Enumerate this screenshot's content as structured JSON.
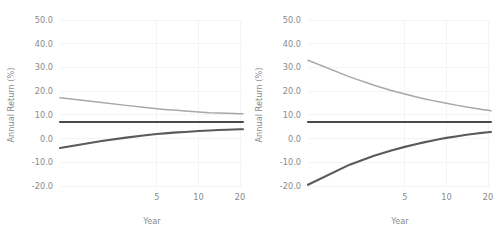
{
  "figure": {
    "panel_count": 2,
    "background": "#ffffff",
    "gridline_color": "#f4f4f4",
    "text_color": "#8a8a8a"
  },
  "chart_data": [
    {
      "type": "line",
      "title": "",
      "panel_position": "left",
      "xlabel": "Year",
      "ylabel": "Annual Return (%)",
      "xscale": "log",
      "xlim": [
        1,
        21
      ],
      "ylim": [
        -20,
        50
      ],
      "grid": true,
      "legend": "none",
      "xticks": [
        5,
        10,
        20
      ],
      "xtick_labels": [
        "5",
        "10",
        "20"
      ],
      "yticks": [
        50,
        40,
        30,
        20,
        10,
        0,
        -10,
        -20
      ],
      "ytick_labels": [
        "50.0",
        "40.0",
        "30.0",
        "20.0",
        "10.0",
        "0.0",
        "-10.0",
        "-20.0"
      ],
      "x": [
        1,
        2,
        3,
        4,
        5,
        6,
        7,
        8,
        9,
        10,
        12,
        14,
        16,
        18,
        20,
        21
      ],
      "series": [
        {
          "name": "upper-bound",
          "color": "#a8a8a8",
          "values": [
            17.2,
            15.2,
            14.0,
            13.2,
            12.6,
            12.2,
            11.9,
            11.6,
            11.4,
            11.2,
            10.9,
            10.8,
            10.7,
            10.6,
            10.5,
            10.5
          ]
        },
        {
          "name": "mean",
          "color": "#4a4a4a",
          "values": [
            7.0,
            7.0,
            7.0,
            7.0,
            7.0,
            7.0,
            7.0,
            7.0,
            7.0,
            7.0,
            7.0,
            7.0,
            7.0,
            7.0,
            7.0,
            7.0
          ]
        },
        {
          "name": "lower-bound",
          "color": "#5a5a5a",
          "values": [
            -4.0,
            -1.0,
            0.4,
            1.3,
            1.9,
            2.3,
            2.6,
            2.8,
            3.0,
            3.2,
            3.4,
            3.6,
            3.7,
            3.8,
            3.9,
            3.9
          ]
        }
      ]
    },
    {
      "type": "line",
      "title": "",
      "panel_position": "right",
      "xlabel": "Year",
      "ylabel": "Annual Return (%)",
      "xscale": "log",
      "xlim": [
        1,
        21
      ],
      "ylim": [
        -20,
        50
      ],
      "grid": true,
      "legend": "none",
      "xticks": [
        5,
        10,
        20
      ],
      "xtick_labels": [
        "5",
        "10",
        "20"
      ],
      "yticks": [
        50,
        40,
        30,
        20,
        10,
        0,
        -10,
        -20
      ],
      "ytick_labels": [
        "50.0",
        "40.0",
        "30.0",
        "20.0",
        "10.0",
        "0.0",
        "-10.0",
        "-20.0"
      ],
      "x": [
        1,
        2,
        3,
        4,
        5,
        6,
        7,
        8,
        9,
        10,
        12,
        14,
        16,
        18,
        20,
        21
      ],
      "series": [
        {
          "name": "upper-bound",
          "color": "#a8a8a8",
          "values": [
            33.0,
            26.0,
            22.5,
            20.3,
            18.8,
            17.6,
            16.7,
            16.0,
            15.4,
            14.9,
            14.0,
            13.3,
            12.8,
            12.3,
            11.9,
            11.7
          ]
        },
        {
          "name": "mean",
          "color": "#4a4a4a",
          "values": [
            7.0,
            7.0,
            7.0,
            7.0,
            7.0,
            7.0,
            7.0,
            7.0,
            7.0,
            7.0,
            7.0,
            7.0,
            7.0,
            7.0,
            7.0,
            7.0
          ]
        },
        {
          "name": "lower-bound",
          "color": "#5a5a5a",
          "values": [
            -19.5,
            -11.0,
            -7.2,
            -5.0,
            -3.5,
            -2.4,
            -1.5,
            -0.8,
            -0.2,
            0.3,
            1.0,
            1.6,
            2.0,
            2.4,
            2.7,
            2.8
          ]
        }
      ]
    }
  ]
}
